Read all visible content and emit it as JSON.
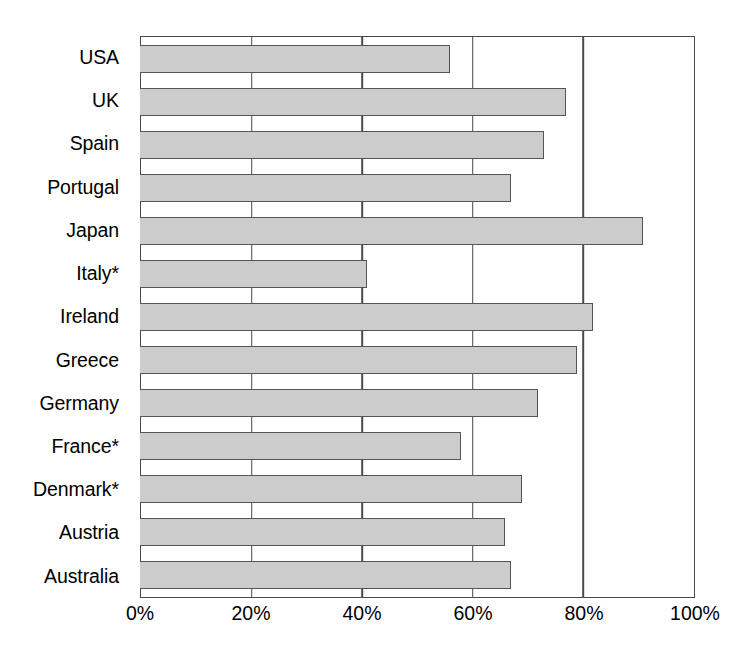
{
  "chart_data": {
    "type": "bar",
    "orientation": "horizontal",
    "title": "",
    "subtitle": "",
    "xlabel": "",
    "ylabel": "",
    "xlim": [
      0,
      100
    ],
    "xtick_labels": [
      "0%",
      "20%",
      "40%",
      "60%",
      "80%",
      "100%"
    ],
    "xticks": [
      0,
      20,
      40,
      60,
      80,
      100
    ],
    "grid": "vertical-gridlines-at-20-40-60-80",
    "legend": "none",
    "value_suffix": "%",
    "bar_fill_color": "#cccccc",
    "bar_border_color": "#555555",
    "axis_color": "#4a4a4a",
    "background_color": "#ffffff",
    "footnote_marker": "*",
    "categories": [
      "USA",
      "UK",
      "Spain",
      "Portugal",
      "Japan",
      "Italy*",
      "Ireland",
      "Greece",
      "Germany",
      "France*",
      "Denmark*",
      "Austria",
      "Australia"
    ],
    "values": [
      56,
      77,
      73,
      67,
      91,
      41,
      82,
      79,
      72,
      58,
      69,
      66,
      67
    ],
    "bars": [
      {
        "label": "USA",
        "value": 56
      },
      {
        "label": "UK",
        "value": 77
      },
      {
        "label": "Spain",
        "value": 73
      },
      {
        "label": "Portugal",
        "value": 67
      },
      {
        "label": "Japan",
        "value": 91
      },
      {
        "label": "Italy*",
        "value": 41
      },
      {
        "label": "Ireland",
        "value": 82
      },
      {
        "label": "Greece",
        "value": 79
      },
      {
        "label": "Germany",
        "value": 72
      },
      {
        "label": "France*",
        "value": 58
      },
      {
        "label": "Denmark*",
        "value": 69
      },
      {
        "label": "Austria",
        "value": 66
      },
      {
        "label": "Australia",
        "value": 67
      }
    ]
  }
}
